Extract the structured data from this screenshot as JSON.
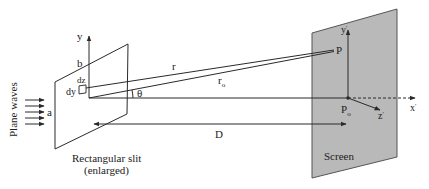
{
  "diagram": {
    "type": "physics-optics",
    "labels": {
      "plane_waves": "Plane waves",
      "slit_caption_line1": "Rectangular slit",
      "slit_caption_line2": "(enlarged)",
      "screen": "Screen",
      "y_axis": "y",
      "b": "b",
      "a": "a",
      "dz": "dz",
      "dy": "dy",
      "r": "r",
      "r0_main": "r",
      "r0_sub": "o",
      "theta": "θ",
      "D": "D",
      "P": "P",
      "P0_main": "P",
      "P0_sub": "o",
      "y_prime": "y",
      "x_prime": "x",
      "z_prime": "z",
      "prime": "'"
    },
    "colors": {
      "line": "#2a2a2a",
      "screen_fill": "#b9b9b9",
      "screen_stroke": "#555555",
      "background": "#ffffff"
    }
  }
}
